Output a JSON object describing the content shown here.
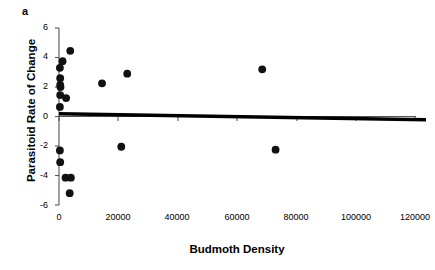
{
  "figure": {
    "panel_label": "a",
    "background_color": "#ffffff",
    "marker_color": "#111111",
    "axis_color": "#555555",
    "regression_line_color": "#000000"
  },
  "chart_data": {
    "type": "scatter",
    "title": "",
    "panel": "a",
    "xlabel": "Budmoth Density",
    "ylabel": "Parasitoid Rate of Change",
    "xlim": [
      0,
      125000
    ],
    "ylim": [
      -6,
      6
    ],
    "xticks": [
      0,
      20000,
      40000,
      60000,
      80000,
      100000,
      120000
    ],
    "xtick_labels": [
      "0",
      "20000",
      "40000",
      "60000",
      "80000",
      "100000",
      "120000"
    ],
    "yticks": [
      -6,
      -4,
      -2,
      0,
      2,
      4,
      6
    ],
    "ytick_labels": [
      "-6",
      "-4",
      "-2",
      "0",
      "2",
      "4",
      "6"
    ],
    "grid": false,
    "legend": null,
    "points": [
      {
        "x": 3800,
        "y": 4.45
      },
      {
        "x": 1200,
        "y": 3.75
      },
      {
        "x": 300,
        "y": 3.3
      },
      {
        "x": 400,
        "y": 2.6
      },
      {
        "x": 400,
        "y": 2.15
      },
      {
        "x": 500,
        "y": 2.0
      },
      {
        "x": 400,
        "y": 1.45
      },
      {
        "x": 2400,
        "y": 1.25
      },
      {
        "x": 300,
        "y": 0.65
      },
      {
        "x": 14500,
        "y": 2.25
      },
      {
        "x": 23000,
        "y": 2.9
      },
      {
        "x": 68500,
        "y": 3.2
      },
      {
        "x": 300,
        "y": -2.3
      },
      {
        "x": 400,
        "y": -3.1
      },
      {
        "x": 2200,
        "y": -4.15
      },
      {
        "x": 4000,
        "y": -4.15
      },
      {
        "x": 3600,
        "y": -5.2
      },
      {
        "x": 21000,
        "y": -2.05
      },
      {
        "x": 73000,
        "y": -2.25
      }
    ],
    "regression_line": {
      "x_start": 0,
      "y_start": 0.18,
      "x_end": 123500,
      "y_end": -0.22,
      "description": "near-flat slightly negative fitted trend line overlapping the zero axis"
    },
    "annotations": []
  }
}
